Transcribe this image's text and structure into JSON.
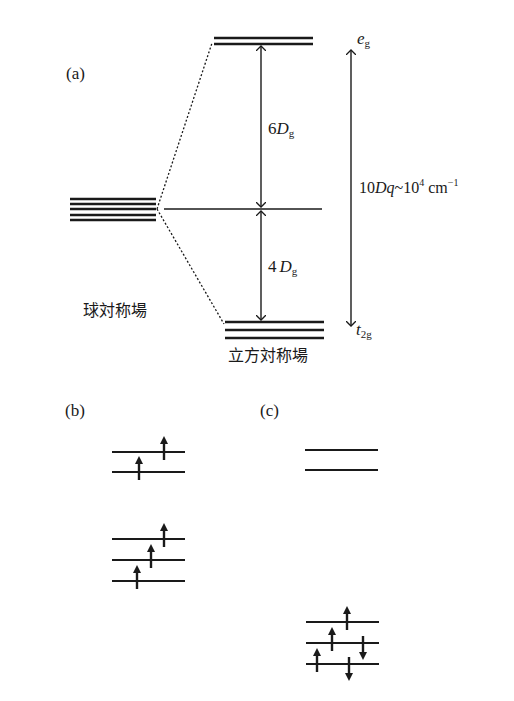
{
  "panel_a": {
    "label": "(a)",
    "spherical_field_label": "球対称場",
    "cubic_field_label": "立方対称場",
    "upper_gap": {
      "coef": "6",
      "symbol": "D",
      "subscript": "g"
    },
    "lower_gap": {
      "coef": "4",
      "symbol": "D",
      "subscript": "g"
    },
    "eg_label": {
      "main": "e",
      "subscript": "g"
    },
    "t2g_label": {
      "main": "t",
      "subscript": "2g"
    },
    "splitting": {
      "prefix": "10",
      "D": "D",
      "q": "q",
      "tilde": "~10",
      "exp": "4",
      "unit": " cm",
      "unit_exp": "−1"
    },
    "degenerate_levels": 5,
    "eg_levels": 2,
    "t2g_levels": 3
  },
  "panel_b": {
    "label": "(b)",
    "upper_levels": 2,
    "lower_levels": 3,
    "electrons": "5 up spins (high spin)"
  },
  "panel_c": {
    "label": "(c)",
    "upper_levels": 2,
    "lower_levels": 3,
    "electrons": "3 up + 2 down spins (low spin)"
  },
  "colors": {
    "line": "#1a1a1a",
    "background": "#ffffff"
  }
}
